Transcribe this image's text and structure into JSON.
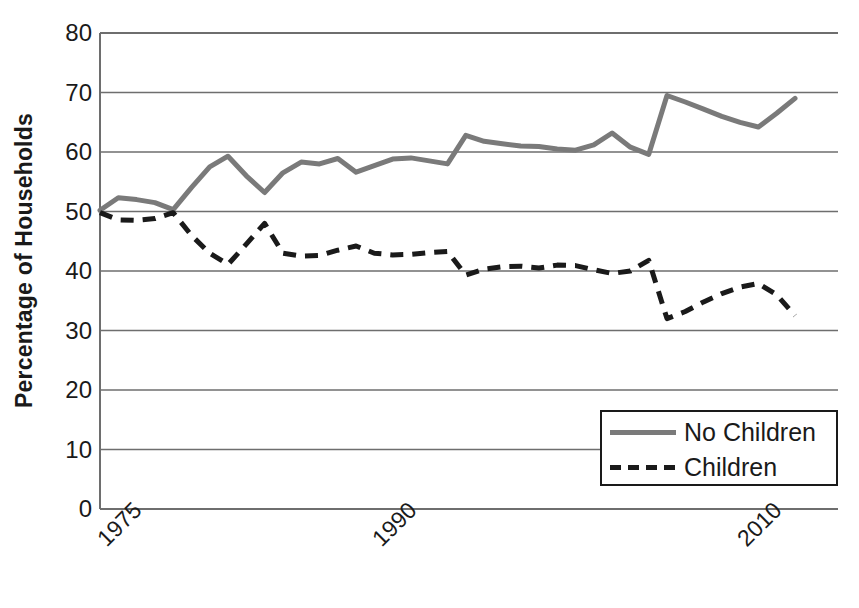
{
  "chart_data": {
    "type": "line",
    "title": "",
    "xlabel": "",
    "ylabel": "Percentage of Households",
    "ylim": [
      0,
      80
    ],
    "ytick_values": [
      0,
      10,
      20,
      30,
      40,
      50,
      60,
      70,
      80
    ],
    "ytick_labels": [
      "0",
      "10",
      "20",
      "30",
      "40",
      "50",
      "60",
      "70",
      "80"
    ],
    "xlim": [
      1974,
      2012
    ],
    "xtick_values": [
      1975,
      1990,
      2010
    ],
    "xtick_labels": [
      "1975",
      "1990",
      "2010"
    ],
    "grid": "horizontal",
    "legend_position": "bottom-right",
    "x": [
      1974,
      1975,
      1976,
      1977,
      1978,
      1979,
      1980,
      1981,
      1982,
      1983,
      1984,
      1985,
      1986,
      1987,
      1988,
      1989,
      1990,
      1991,
      1992,
      1993,
      1994,
      1995,
      1996,
      1997,
      1998,
      1999,
      2000,
      2001,
      2002,
      2003,
      2004,
      2005,
      2006,
      2007,
      2008,
      2009,
      2010,
      2011,
      2012
    ],
    "series": [
      {
        "name": "No Children",
        "style": "solid",
        "color": "#7a7a7a",
        "values": [
          50.2,
          52.3,
          52.0,
          51.5,
          50.3,
          54.0,
          57.5,
          59.3,
          56.0,
          53.2,
          56.5,
          58.3,
          58.0,
          58.9,
          56.6,
          57.7,
          58.8,
          59.0,
          58.5,
          58.0,
          62.8,
          61.8,
          61.4,
          61.0,
          60.9,
          60.5,
          60.3,
          61.2,
          63.2,
          60.8,
          59.6,
          69.5,
          68.4,
          67.2,
          66.0,
          65.0,
          64.2,
          66.5,
          69.0
        ]
      },
      {
        "name": "Children",
        "style": "dashed",
        "color": "#1a1a1a",
        "values": [
          49.8,
          48.6,
          48.5,
          48.8,
          49.8,
          46.0,
          43.0,
          41.1,
          44.5,
          48.0,
          43.0,
          42.5,
          42.6,
          43.5,
          44.2,
          43.0,
          42.7,
          42.8,
          43.1,
          43.3,
          39.3,
          40.3,
          40.7,
          40.8,
          40.5,
          41.0,
          40.9,
          40.2,
          39.6,
          40.0,
          41.8,
          32.0,
          33.2,
          34.8,
          36.2,
          37.3,
          37.9,
          36.0,
          32.5
        ]
      }
    ]
  },
  "legend": {
    "items": [
      {
        "label": "No Children"
      },
      {
        "label": "Children"
      }
    ]
  }
}
